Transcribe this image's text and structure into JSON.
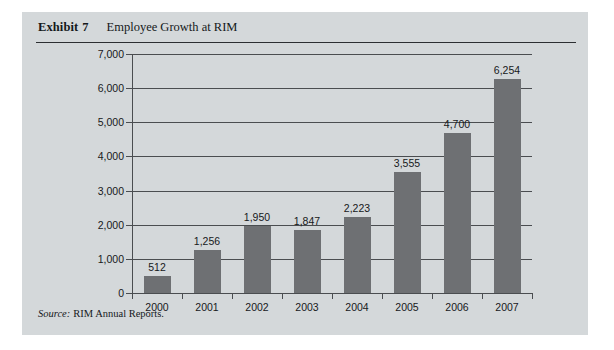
{
  "exhibit": {
    "label": "Exhibit",
    "number": "7",
    "title": "Employee Growth at RIM"
  },
  "source": {
    "label": "Source:",
    "text": "RIM Annual Reports."
  },
  "colors": {
    "panel_background": "#d4d8da",
    "bar_fill": "#6e7073",
    "axis": "#4a4d50",
    "text": "#15181a"
  },
  "chart_data": {
    "type": "bar",
    "title": "Employee Growth at RIM",
    "xlabel": "",
    "ylabel": "",
    "categories": [
      "2000",
      "2001",
      "2002",
      "2003",
      "2004",
      "2005",
      "2006",
      "2007"
    ],
    "values": [
      512,
      1256,
      1950,
      1847,
      2223,
      3555,
      4700,
      6254
    ],
    "value_labels": [
      "512",
      "1,256",
      "1,950",
      "1,847",
      "2,223",
      "3,555",
      "4,700",
      "6,254"
    ],
    "ylim": [
      0,
      7000
    ],
    "ytick_values": [
      0,
      1000,
      2000,
      3000,
      4000,
      5000,
      6000,
      7000
    ],
    "ytick_labels": [
      "0",
      "1,000",
      "2,000",
      "3,000",
      "4,000",
      "5,000",
      "6,000",
      "7,000"
    ],
    "grid": true,
    "legend": null
  }
}
